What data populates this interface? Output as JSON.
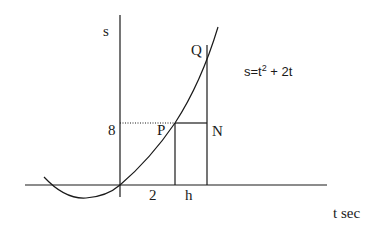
{
  "diagram": {
    "equation": "s=t",
    "equation_sup": "2",
    "equation_rest": " + 2t",
    "labels": {
      "s_axis": "s",
      "t_axis": "t sec",
      "point_p": "P",
      "point_q": "Q",
      "point_n": "N",
      "y_tick": "8",
      "x_tick_2": "2",
      "x_tick_h": "h"
    },
    "colors": {
      "stroke": "#1a1a1a",
      "background": "#ffffff"
    }
  }
}
